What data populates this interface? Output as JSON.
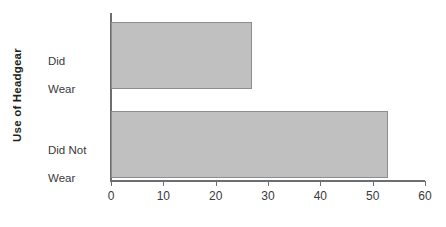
{
  "chart_data": {
    "type": "bar",
    "orientation": "horizontal",
    "title": "",
    "xlabel": "",
    "ylabel": "Use of Headgear",
    "categories": [
      "Did Wear",
      "Did Not Wear"
    ],
    "category_lines": [
      [
        "Did",
        "Wear"
      ],
      [
        "Did Not",
        "Wear"
      ]
    ],
    "values": [
      27,
      53
    ],
    "xlim": [
      0,
      60
    ],
    "xticks": [
      0,
      10,
      20,
      30,
      40,
      50,
      60
    ],
    "xticklabels": [
      "0",
      "10",
      "20",
      "30",
      "40",
      "50",
      "60"
    ],
    "grid": false,
    "legend": false,
    "bar_color": "#c0c0c0",
    "bar_edge_color": "#8d8e90",
    "axis_color": "#6d6e71",
    "text_color": "#231f20",
    "background": "#ffffff"
  }
}
